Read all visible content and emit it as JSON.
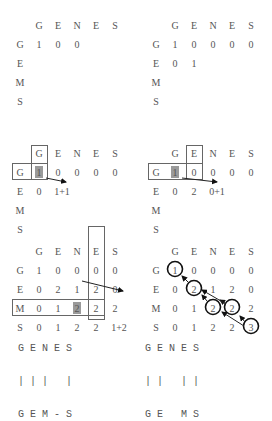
{
  "figure": {
    "seq_top": [
      "G",
      "E",
      "N",
      "E",
      "S"
    ],
    "seq_side": [
      "G",
      "E",
      "M",
      "S"
    ]
  },
  "panels": [
    {
      "id": "p1",
      "cells": [
        [
          "1",
          "0",
          "0",
          "",
          "",
          ""
        ],
        [
          "",
          "",
          "",
          "",
          "",
          ""
        ],
        [
          "",
          "",
          "",
          "",
          "",
          ""
        ],
        [
          "",
          "",
          "",
          "",
          "",
          ""
        ]
      ]
    },
    {
      "id": "p2",
      "cells": [
        [
          "1",
          "0",
          "0",
          "0",
          "0"
        ],
        [
          "0",
          "1",
          "",
          "",
          ""
        ],
        [
          "",
          "",
          "",
          "",
          ""
        ],
        [
          "",
          "",
          "",
          "",
          ""
        ]
      ]
    },
    {
      "id": "p3",
      "cells": [
        [
          "1",
          "0",
          "0",
          "0",
          "0"
        ],
        [
          "0",
          "1+1",
          "",
          "",
          ""
        ],
        [
          "",
          "",
          "",
          "",
          ""
        ],
        [
          "",
          "",
          "",
          "",
          ""
        ]
      ]
    },
    {
      "id": "p4",
      "cells": [
        [
          "1",
          "0",
          "0",
          "0",
          "0"
        ],
        [
          "0",
          "2",
          "0+1",
          "",
          ""
        ],
        [
          "",
          "",
          "",
          "",
          ""
        ],
        [
          "",
          "",
          "",
          "",
          ""
        ]
      ]
    },
    {
      "id": "p5",
      "cells": [
        [
          "1",
          "0",
          "0",
          "0",
          "0"
        ],
        [
          "0",
          "2",
          "1",
          "2",
          "0"
        ],
        [
          "0",
          "1",
          "2",
          "2",
          "2"
        ],
        [
          "0",
          "1",
          "2",
          "2",
          "1+2"
        ]
      ]
    },
    {
      "id": "p6",
      "cells": [
        [
          "1",
          "0",
          "0",
          "0",
          "0"
        ],
        [
          "0",
          "2",
          "1",
          "2",
          "0"
        ],
        [
          "0",
          "1",
          "2",
          "2",
          "2"
        ],
        [
          "0",
          "1",
          "2",
          "2",
          "3"
        ]
      ]
    }
  ],
  "alignments": [
    {
      "top": "G E N E S",
      "bars": "| | |   |",
      "bottom": "G E M - S"
    },
    {
      "top": "G E N E S",
      "bars": "| |   | |",
      "bottom": "G E   M S"
    }
  ]
}
